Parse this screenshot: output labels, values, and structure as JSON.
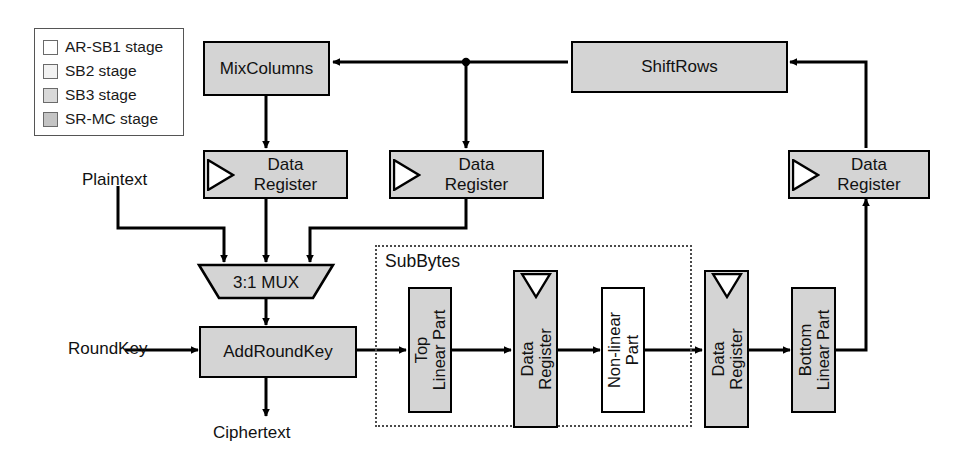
{
  "diagram": {
    "colors": {
      "block_fill": "#d4d4d4",
      "white_fill": "#ffffff",
      "stroke": "#000000",
      "dotted_border": "#4a4a4a",
      "legend_border": "#555555"
    }
  },
  "legend": {
    "items": [
      {
        "label": "AR-SB1 stage",
        "swatch": "#ffffff"
      },
      {
        "label": "SB2 stage",
        "swatch": "#f2f2f2"
      },
      {
        "label": "SB3 stage",
        "swatch": "#d9d9d9"
      },
      {
        "label": "SR-MC stage",
        "swatch": "#c4c4c4"
      }
    ]
  },
  "blocks": {
    "mixcolumns": "MixColumns",
    "shiftrows": "ShiftRows",
    "data_register_1": "Data\nRegister",
    "data_register_1_line1": "Data",
    "data_register_1_line2": "Register",
    "data_register_2_line1": "Data",
    "data_register_2_line2": "Register",
    "data_register_3_line1": "Data",
    "data_register_3_line2": "Register",
    "mux": "3:1 MUX",
    "addroundkey": "AddRoundKey",
    "subbytes_title": "SubBytes",
    "top_linear_part": "Top\nLinear Part",
    "top_linear_part_l1": "Top",
    "top_linear_part_l2": "Linear Part",
    "sb_data_register_1_l1": "Data",
    "sb_data_register_1_l2": "Register",
    "nonlinear_part_l1": "Non-linear",
    "nonlinear_part_l2": "Part",
    "sb_data_register_2_l1": "Data",
    "sb_data_register_2_l2": "Register",
    "bottom_linear_part_l1": "Bottom",
    "bottom_linear_part_l2": "Linear Part"
  },
  "labels": {
    "plaintext": "Plaintext",
    "roundkey": "RoundKey",
    "ciphertext": "Ciphertext"
  }
}
